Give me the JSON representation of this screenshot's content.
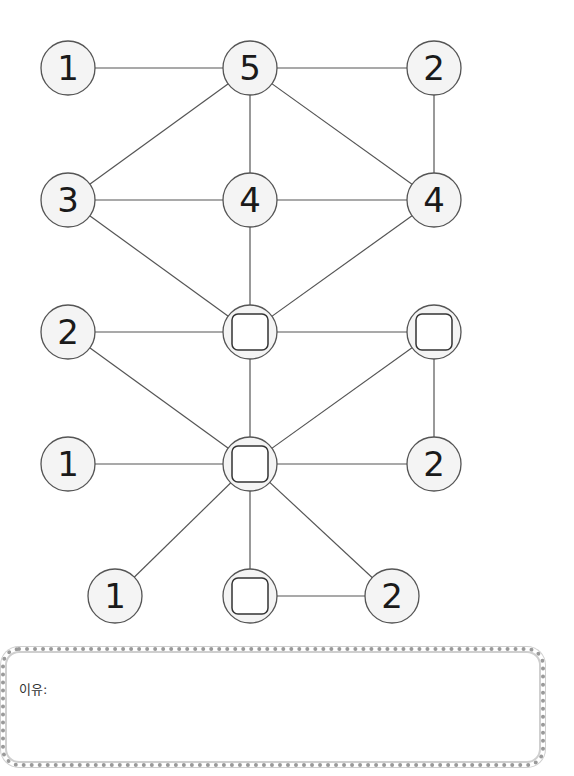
{
  "diagram": {
    "node_radius": 27,
    "colors": {
      "node_fill": "#f4f4f4",
      "node_stroke": "#555555",
      "edge": "#555555",
      "text": "#1a1a1a"
    },
    "nodes": [
      {
        "id": "r1c1",
        "x": 68,
        "y": 68,
        "label": "1",
        "type": "number"
      },
      {
        "id": "r1c2",
        "x": 250,
        "y": 68,
        "label": "5",
        "type": "number"
      },
      {
        "id": "r1c3",
        "x": 434,
        "y": 68,
        "label": "2",
        "type": "number"
      },
      {
        "id": "r2c1",
        "x": 68,
        "y": 200,
        "label": "3",
        "type": "number"
      },
      {
        "id": "r2c2",
        "x": 250,
        "y": 200,
        "label": "4",
        "type": "number"
      },
      {
        "id": "r2c3",
        "x": 434,
        "y": 200,
        "label": "4",
        "type": "number"
      },
      {
        "id": "r3c1",
        "x": 68,
        "y": 332,
        "label": "2",
        "type": "number"
      },
      {
        "id": "r3c2",
        "x": 250,
        "y": 332,
        "label": "",
        "type": "blank"
      },
      {
        "id": "r3c3",
        "x": 434,
        "y": 332,
        "label": "",
        "type": "blank"
      },
      {
        "id": "r4c1",
        "x": 68,
        "y": 464,
        "label": "1",
        "type": "number"
      },
      {
        "id": "r4c2",
        "x": 250,
        "y": 464,
        "label": "",
        "type": "blank"
      },
      {
        "id": "r4c3",
        "x": 434,
        "y": 464,
        "label": "2",
        "type": "number"
      },
      {
        "id": "r5c1",
        "x": 115,
        "y": 596,
        "label": "1",
        "type": "number"
      },
      {
        "id": "r5c2",
        "x": 250,
        "y": 596,
        "label": "",
        "type": "blank"
      },
      {
        "id": "r5c3",
        "x": 392,
        "y": 596,
        "label": "2",
        "type": "number"
      }
    ],
    "edges": [
      [
        "r1c1",
        "r1c2"
      ],
      [
        "r1c2",
        "r1c3"
      ],
      [
        "r1c2",
        "r2c1"
      ],
      [
        "r1c2",
        "r2c2"
      ],
      [
        "r1c2",
        "r2c3"
      ],
      [
        "r1c3",
        "r2c3"
      ],
      [
        "r2c1",
        "r2c2"
      ],
      [
        "r2c2",
        "r2c3"
      ],
      [
        "r2c1",
        "r3c2"
      ],
      [
        "r2c2",
        "r3c2"
      ],
      [
        "r2c3",
        "r3c2"
      ],
      [
        "r3c1",
        "r3c2"
      ],
      [
        "r3c2",
        "r3c3"
      ],
      [
        "r3c1",
        "r4c2"
      ],
      [
        "r3c2",
        "r4c2"
      ],
      [
        "r3c3",
        "r4c2"
      ],
      [
        "r3c3",
        "r4c3"
      ],
      [
        "r4c1",
        "r4c2"
      ],
      [
        "r4c2",
        "r4c3"
      ],
      [
        "r4c2",
        "r5c1"
      ],
      [
        "r4c2",
        "r5c2"
      ],
      [
        "r4c2",
        "r5c3"
      ],
      [
        "r5c2",
        "r5c3"
      ]
    ]
  },
  "answer_box": {
    "label": "이유:",
    "value": ""
  }
}
